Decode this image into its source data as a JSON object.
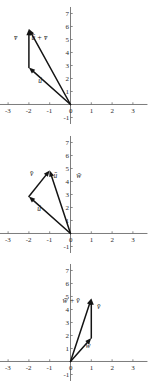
{
  "figure": {
    "panel_count": 3,
    "background_color": "#ffffff",
    "axis_color": "#6e6e6e",
    "vector_color": "#141414"
  },
  "chart_data": [
    {
      "type": "scatter",
      "title": "",
      "panel_index": 1,
      "xlabel": "",
      "ylabel": "",
      "xlim": [
        -3.6,
        3.6
      ],
      "ylim": [
        -1.4,
        7.4
      ],
      "grid": false,
      "legend": "none",
      "xticks": [
        -3,
        -2,
        -1,
        0,
        1,
        2,
        3
      ],
      "xtick_labels": [
        "-3",
        "-2",
        "-1",
        "0",
        "1",
        "2",
        "3"
      ],
      "yticks": [
        -1,
        1,
        2,
        3,
        4,
        5,
        6,
        7
      ],
      "ytick_labels": [
        "-1",
        "1",
        "2",
        "3",
        "4",
        "5",
        "6",
        "7"
      ],
      "vectors": [
        {
          "name": "u",
          "label": "ū",
          "tail": [
            0,
            0
          ],
          "head": [
            -2,
            2.85
          ],
          "label_pos": [
            -1.55,
            1.65
          ]
        },
        {
          "name": "v",
          "label": "v̄",
          "tail": [
            -2,
            2.85
          ],
          "head": [
            -2,
            5.8
          ],
          "label_pos": [
            -2.72,
            4.95
          ]
        },
        {
          "name": "u+v",
          "label": "ū + v̄",
          "tail": [
            0,
            0
          ],
          "head": [
            -2,
            5.8
          ],
          "label_pos": [
            -1.88,
            4.95
          ]
        }
      ]
    },
    {
      "type": "scatter",
      "title": "",
      "panel_index": 2,
      "xlabel": "",
      "ylabel": "",
      "xlim": [
        -3.6,
        3.6
      ],
      "ylim": [
        -1.4,
        7.4
      ],
      "grid": false,
      "legend": "none",
      "xticks": [
        -3,
        -2,
        -1,
        0,
        1,
        2,
        3
      ],
      "xtick_labels": [
        "-3",
        "-2",
        "-1",
        "0",
        "1",
        "2",
        "3"
      ],
      "yticks": [
        -1,
        1,
        2,
        3,
        4,
        5,
        6,
        7
      ],
      "ytick_labels": [
        "-1",
        "1",
        "2",
        "3",
        "4",
        "5",
        "6",
        "7"
      ],
      "vectors": [
        {
          "name": "u",
          "label": "ū",
          "tail": [
            0,
            0
          ],
          "head": [
            -2,
            2.85
          ],
          "label_pos": [
            -1.6,
            1.7
          ]
        },
        {
          "name": "v",
          "label": "v̄",
          "tail": [
            -2,
            2.85
          ],
          "head": [
            -1,
            4.85
          ],
          "label_pos": [
            -1.95,
            4.45
          ]
        },
        {
          "name": "w-inner",
          "label": "ū",
          "tail": [
            0,
            0
          ],
          "head": [
            -1,
            4.85
          ],
          "label_pos": [
            -0.82,
            4.3
          ]
        },
        {
          "name": "w",
          "label": "w̄",
          "tail": null,
          "head": null,
          "label_pos": [
            0.28,
            4.3
          ]
        }
      ]
    },
    {
      "type": "scatter",
      "title": "",
      "panel_index": 3,
      "xlabel": "",
      "ylabel": "",
      "xlim": [
        -3.6,
        3.6
      ],
      "ylim": [
        -1.4,
        7.4
      ],
      "grid": false,
      "legend": "none",
      "xticks": [
        -3,
        -2,
        -1,
        0,
        1,
        2,
        3
      ],
      "xtick_labels": [
        "-3",
        "-2",
        "-1",
        "0",
        "1",
        "2",
        "3"
      ],
      "yticks": [
        -1,
        1,
        2,
        3,
        4,
        5,
        6,
        7
      ],
      "ytick_labels": [
        "-1",
        "1",
        "2",
        "3",
        "4",
        "5",
        "6",
        "7"
      ],
      "vectors": [
        {
          "name": "w",
          "label": "w̄",
          "tail": [
            0,
            0
          ],
          "head": [
            1,
            1.8
          ],
          "label_pos": [
            0.72,
            1.05
          ]
        },
        {
          "name": "v",
          "label": "v̄",
          "tail": [
            1,
            1.8
          ],
          "head": [
            1,
            4.85
          ],
          "label_pos": [
            1.28,
            4.05
          ]
        },
        {
          "name": "w+v",
          "label": "w̄ + v̄",
          "tail": [
            0,
            0
          ],
          "head": [
            1,
            4.85
          ],
          "label_pos": [
            -0.38,
            4.5
          ]
        }
      ]
    }
  ]
}
